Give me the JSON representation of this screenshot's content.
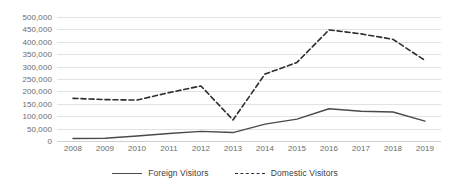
{
  "chart_data": {
    "type": "line",
    "title": "",
    "xlabel": "",
    "ylabel": "",
    "categories": [
      "2008",
      "2009",
      "2010",
      "2011",
      "2012",
      "2013",
      "2014",
      "2015",
      "2016",
      "2017",
      "2018",
      "2019"
    ],
    "series": [
      {
        "name": "Foreign Visitors",
        "style": "solid",
        "color": "#4a4a4a",
        "values": [
          10000,
          11000,
          20000,
          30000,
          39000,
          34000,
          68000,
          88000,
          130000,
          120000,
          117000,
          80000
        ]
      },
      {
        "name": "Domestic Visitors",
        "style": "dashed",
        "color": "#2e2e2e",
        "values": [
          172000,
          167000,
          165000,
          195000,
          222000,
          85000,
          270000,
          317000,
          448000,
          432000,
          410000,
          325000
        ]
      }
    ],
    "ylim": [
      0,
      500000
    ],
    "ytick_values": [
      0,
      50000,
      100000,
      150000,
      200000,
      250000,
      300000,
      350000,
      400000,
      450000,
      500000
    ],
    "ytick_labels": [
      "0",
      "50,000",
      "100,000",
      "150,000",
      "200,000",
      "250,000",
      "300,000",
      "350,000",
      "400,000",
      "450,000",
      "500,000"
    ],
    "grid": true,
    "legend_position": "bottom"
  },
  "legend": {
    "items": [
      {
        "label": "Foreign Visitors",
        "style": "solid"
      },
      {
        "label": "Domestic Visitors",
        "style": "dashed"
      }
    ]
  },
  "colors": {
    "background": "#ffffff",
    "gridline": "#e2e2e2",
    "axis_text": "#6b6b6b",
    "foreign_series": "#4a4a4a",
    "domestic_series": "#2e2e2e"
  }
}
